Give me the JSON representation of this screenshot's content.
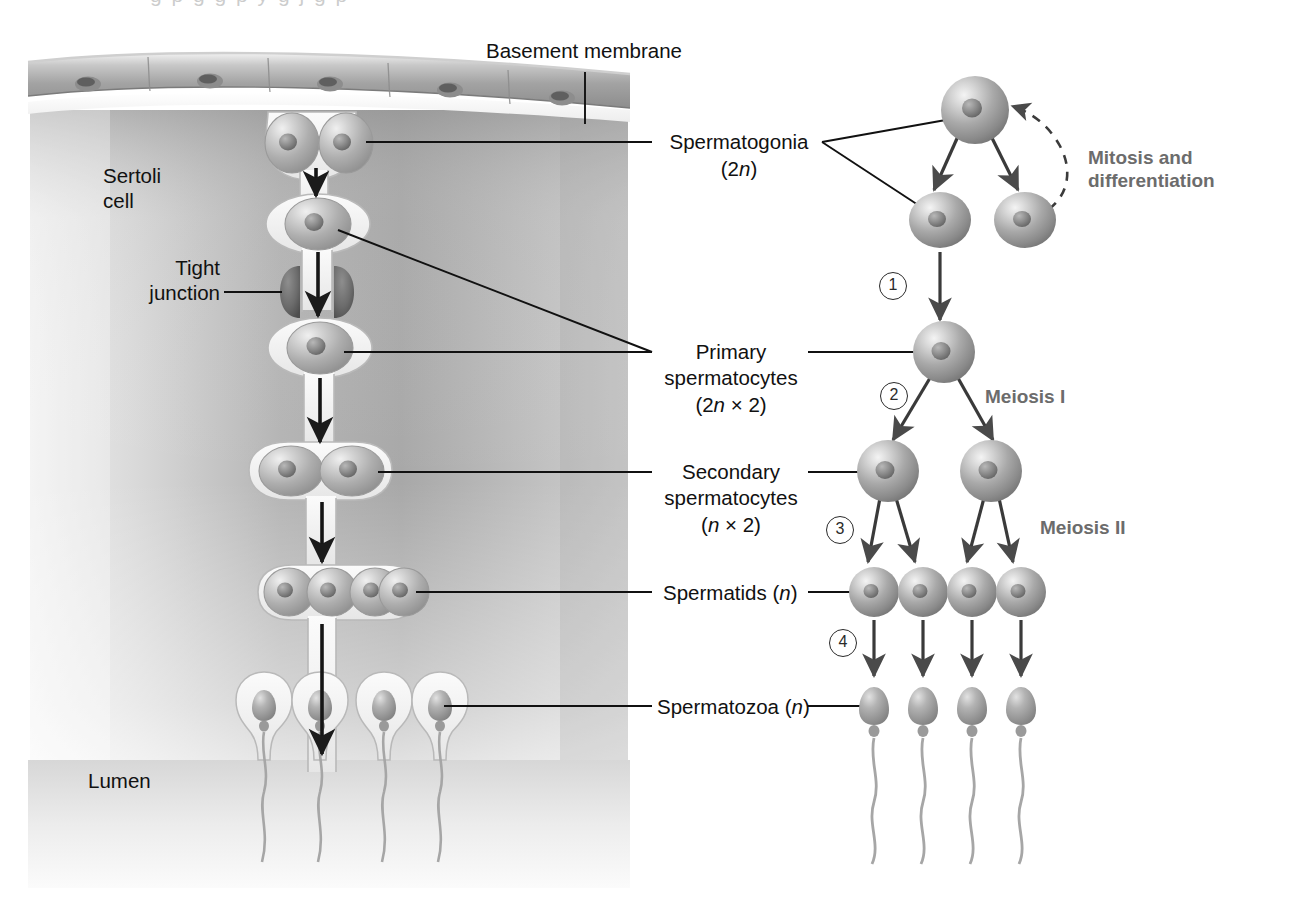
{
  "figure": {
    "background_color": "#ffffff",
    "ink_color": "#111111",
    "accent_gray": "#6c6c6c"
  },
  "left_panel": {
    "name": "seminiferous-tubule-cross-section",
    "labels": [
      {
        "id": "basement-membrane",
        "text": "Basement membrane"
      },
      {
        "id": "sertoli-cell",
        "line1": "Sertoli",
        "line2": "cell"
      },
      {
        "id": "tight-junction",
        "line1": "Tight",
        "line2": "junction"
      },
      {
        "id": "lumen",
        "text": "Lumen"
      }
    ],
    "cell_stages": [
      {
        "stage": "spermatogonia",
        "count": 2
      },
      {
        "stage": "primary-spermatocyte",
        "count": 1
      },
      {
        "stage": "primary-spermatocyte-lower",
        "count": 1
      },
      {
        "stage": "secondary-spermatocytes",
        "count": 2
      },
      {
        "stage": "spermatids",
        "count": 4
      },
      {
        "stage": "spermatozoa",
        "count": 4
      }
    ]
  },
  "right_panel": {
    "name": "lineage-flow-diagram",
    "stage_labels": [
      {
        "id": "spermatogonia",
        "line1": "Spermatogonia",
        "ploidy": "(2n)"
      },
      {
        "id": "primary-spermatocytes",
        "line1": "Primary",
        "line2": "spermatocytes",
        "ploidy": "(2n × 2)"
      },
      {
        "id": "secondary-spermatocytes",
        "line1": "Secondary",
        "line2": "spermatocytes",
        "ploidy": "(n × 2)"
      },
      {
        "id": "spermatids",
        "line1": "Spermatids",
        "ploidy": "(n)"
      },
      {
        "id": "spermatozoa",
        "line1": "Spermatozoa",
        "ploidy": "(n)"
      }
    ],
    "process_labels": [
      {
        "id": "mitosis-and-differentiation",
        "line1": "Mitosis and",
        "line2": "differentiation"
      },
      {
        "id": "meiosis-i",
        "text": "Meiosis I"
      },
      {
        "id": "meiosis-ii",
        "text": "Meiosis II"
      }
    ],
    "step_numbers": [
      "1",
      "2",
      "3",
      "4"
    ],
    "cell_counts": {
      "spermatogonia_top": 1,
      "spermatogonia_daughters": 2,
      "primary_spermatocyte": 1,
      "secondary_spermatocytes": 2,
      "spermatids": 4,
      "spermatozoa": 4
    }
  },
  "top_artifact": {
    "text": "fragment of cropped text from page above"
  }
}
